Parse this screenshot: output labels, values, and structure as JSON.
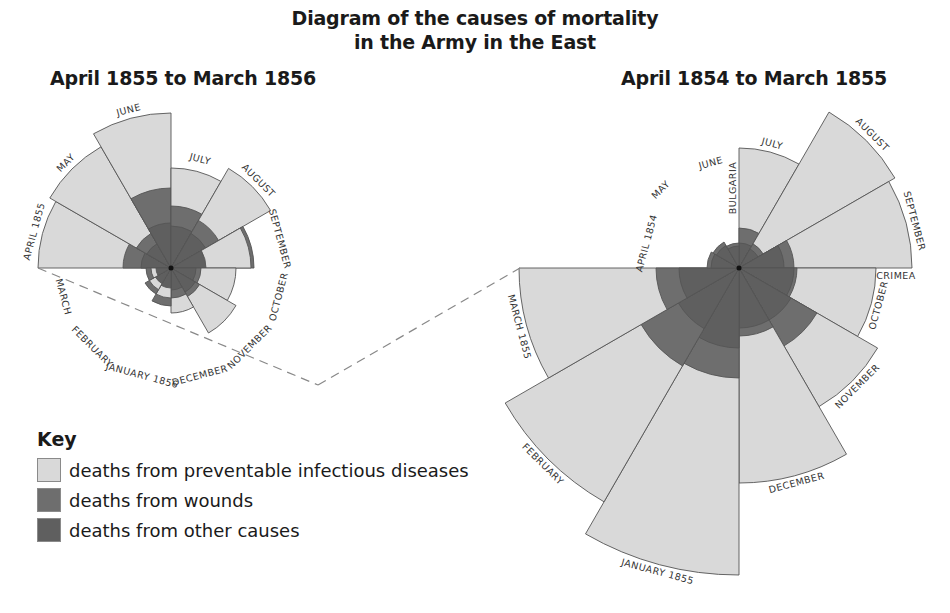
{
  "title": {
    "line1": "Diagram of the causes of mortality",
    "line2": "in the Army in the East"
  },
  "key": {
    "title": "Key",
    "items": [
      {
        "label": "deaths from preventable infectious diseases",
        "color": "#d9d9d9"
      },
      {
        "label": "deaths from wounds",
        "color": "#6e6e6e"
      },
      {
        "label": "deaths from other causes",
        "color": "#5f5f5f"
      }
    ]
  },
  "colors": {
    "disease": "#d9d9d9",
    "wounds": "#6e6e6e",
    "other": "#5f5f5f",
    "outline": "#555555",
    "dash": "#888888"
  },
  "chart_data": [
    {
      "type": "polar-area",
      "title": "April 1855 to March 1856",
      "center": [
        171,
        268
      ],
      "start_angle_deg": 270,
      "label_radius": 112,
      "categories": [
        "APRIL 1855",
        "MAY",
        "JUNE",
        "JULY",
        "AUGUST",
        "SEPTEMBER",
        "OCTOBER",
        "NOVEMBER",
        "DECEMBER",
        "JANUARY 1856",
        "FEBRUARY",
        "MARCH"
      ],
      "series": [
        {
          "name": "deaths from preventable infectious diseases",
          "values": [
            133,
            140,
            155,
            100,
            115,
            80,
            65,
            75,
            45,
            30,
            25,
            20
          ]
        },
        {
          "name": "deaths from wounds",
          "values": [
            48,
            40,
            80,
            62,
            55,
            83,
            30,
            33,
            30,
            38,
            30,
            25
          ]
        },
        {
          "name": "deaths from other causes",
          "values": [
            30,
            28,
            45,
            42,
            40,
            35,
            25,
            28,
            22,
            20,
            18,
            15
          ]
        }
      ],
      "note": "values are wedge radii in pixels (area proportional to deaths)"
    },
    {
      "type": "polar-area",
      "title": "April 1854 to March 1855",
      "center": [
        739,
        268
      ],
      "start_angle_deg": 0,
      "label_radius_extra": 8,
      "categories": [
        "JULY",
        "AUGUST",
        "SEPTEMBER",
        "OCTOBER",
        "NOVEMBER",
        "DECEMBER",
        "JANUARY 1855",
        "FEBRUARY",
        "MARCH 1855",
        "APRIL 1854",
        "MAY",
        "JUNE"
      ],
      "series": [
        {
          "name": "deaths from preventable infectious diseases",
          "values": [
            120,
            180,
            173,
            137,
            160,
            215,
            307,
            270,
            220,
            0,
            0,
            0
          ]
        },
        {
          "name": "deaths from wounds",
          "values": [
            40,
            28,
            55,
            58,
            90,
            68,
            110,
            113,
            83,
            32,
            30,
            25
          ]
        },
        {
          "name": "deaths from other causes",
          "values": [
            25,
            22,
            45,
            55,
            60,
            60,
            80,
            70,
            60,
            28,
            26,
            22
          ]
        }
      ],
      "region_labels": [
        "BULGARIA",
        "CRIMEA"
      ],
      "note": "values are wedge radii in pixels (area proportional to deaths)"
    }
  ]
}
